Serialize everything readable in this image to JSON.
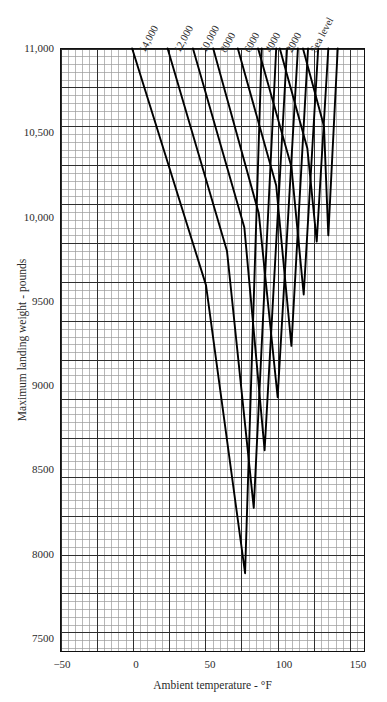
{
  "chart_data": {
    "type": "line",
    "title": "",
    "xlabel": "Ambient temperature - °F",
    "ylabel": "Maximum landing weight - pounds",
    "xlim": [
      -55,
      155
    ],
    "ylim": [
      7127,
      11000
    ],
    "x_ticks": [
      "−50",
      "0",
      "50",
      "100",
      "150"
    ],
    "x_tick_values": [
      -50,
      0,
      50,
      100,
      150
    ],
    "y_ticks": [
      "11,000",
      "10,500",
      "10,000",
      "9500",
      "9000",
      "8500",
      "8000",
      "7500"
    ],
    "y_tick_values": [
      11000,
      10500,
      10000,
      9500,
      9000,
      8500,
      8000,
      7500
    ],
    "grid": true,
    "grid_minor_step_x": 5,
    "grid_minor_step_y": 50,
    "grid_major_step_x": 25,
    "grid_major_step_y": 250,
    "legend_position": "top-inline-rotated",
    "series": [
      {
        "name": "14,000",
        "label": "14,000",
        "label_x": 6,
        "points": [
          [
            -5.5,
            11000
          ],
          [
            45.5,
            9480
          ],
          [
            72.5,
            7630
          ],
          [
            84.0,
            11000
          ]
        ]
      },
      {
        "name": "12,000",
        "label": "12,000",
        "label_x": 30,
        "points": [
          [
            19.0,
            11000
          ],
          [
            60.0,
            9700
          ],
          [
            78.5,
            8050
          ],
          [
            94.0,
            11000
          ]
        ]
      },
      {
        "name": "10,000",
        "label": "10,000",
        "label_x": 48,
        "points": [
          [
            36.5,
            11000
          ],
          [
            72.0,
            9850
          ],
          [
            86.0,
            8420
          ],
          [
            101.5,
            11000
          ]
        ]
      },
      {
        "name": "8000",
        "label": "8000",
        "label_x": 62,
        "points": [
          [
            50.5,
            11000
          ],
          [
            82.0,
            9940
          ],
          [
            95.0,
            8760
          ],
          [
            109.0,
            11000
          ]
        ]
      },
      {
        "name": "6000",
        "label": "6000",
        "label_x": 79,
        "points": [
          [
            67.5,
            11000
          ],
          [
            94.0,
            10120
          ],
          [
            104.5,
            9090
          ],
          [
            116.0,
            11000
          ]
        ]
      },
      {
        "name": "4000",
        "label": "4000",
        "label_x": 93,
        "points": [
          [
            81.5,
            11000
          ],
          [
            104.5,
            10240
          ],
          [
            113.0,
            9420
          ],
          [
            123.0,
            11000
          ]
        ]
      },
      {
        "name": "2000",
        "label": "2000",
        "label_x": 108,
        "points": [
          [
            96.5,
            11000
          ],
          [
            115.5,
            10360
          ],
          [
            122.0,
            9760
          ],
          [
            130.0,
            11000
          ]
        ]
      },
      {
        "name": "Sea level",
        "label": "Sea level",
        "label_x": 124,
        "points": [
          [
            112.5,
            11000
          ],
          [
            127.0,
            10500
          ],
          [
            130.0,
            9800
          ],
          [
            136.5,
            11000
          ]
        ]
      }
    ]
  },
  "axes": {
    "x_title": "Ambient temperature - °F",
    "y_title": "Maximum landing weight - pounds"
  }
}
